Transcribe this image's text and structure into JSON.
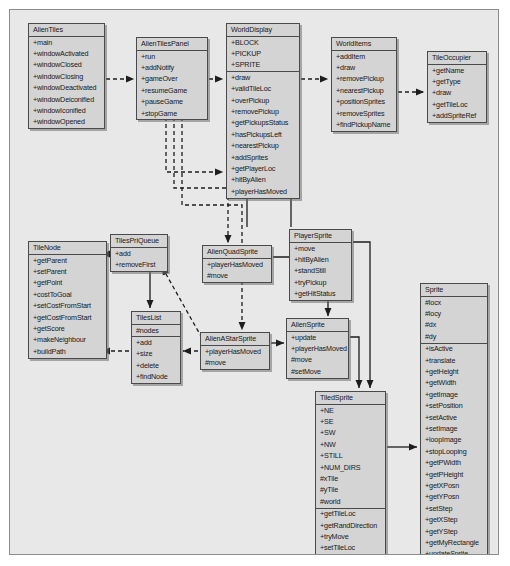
{
  "diagram": {
    "type": "uml-class-diagram",
    "canvas": {
      "width": 490,
      "height": 546,
      "background": "#e8e8e8",
      "border_color": "#8c8c8c"
    },
    "style": {
      "class_fill": "#d4d4d4",
      "class_border": "#4a4a4a",
      "text_color": "#181818"
    },
    "classes": [
      {
        "id": "alien-tiles",
        "name": "AlienTiles",
        "x": 18,
        "y": 13,
        "width": 77,
        "compartments": [
          {
            "members": [
              "+main",
              "+windowActivated",
              "+windowClosed",
              "+windowClosing",
              "+windowDeactivated",
              "+windowDeiconified",
              "+windowIconified",
              "+windowOpened"
            ]
          }
        ]
      },
      {
        "id": "alien-tiles-panel",
        "name": "AlienTilesPanel",
        "x": 126,
        "y": 27,
        "width": 72,
        "compartments": [
          {
            "members": [
              "+run",
              "+addNotify",
              "+gameOver",
              "+resumeGame",
              "+pauseGame",
              "+stopGame"
            ]
          }
        ]
      },
      {
        "id": "world-display",
        "name": "WorldDisplay",
        "x": 216,
        "y": 13,
        "width": 74,
        "compartments": [
          {
            "members": [
              "+BLOCK",
              "+PICKUP",
              "+SPRITE"
            ]
          },
          {
            "members": [
              "+draw",
              "+validTileLoc",
              "+overPickup",
              "+removePickup",
              "+getPickupsStatus",
              "+hasPickupsLeft",
              "+nearestPickup",
              "+addSprites",
              "+getPlayerLoc",
              "+hitByAlien",
              "+playerHasMoved"
            ]
          }
        ]
      },
      {
        "id": "world-items",
        "name": "WorldItems",
        "x": 321,
        "y": 27,
        "width": 66,
        "compartments": [
          {
            "members": [
              "+addItem",
              "+draw",
              "+removePickup",
              "+nearestPickup",
              "+positionSprites",
              "+removeSprites",
              "+findPickupName"
            ]
          }
        ]
      },
      {
        "id": "tile-occupier",
        "name": "TileOccupier",
        "x": 417,
        "y": 41,
        "width": 60,
        "compartments": [
          {
            "members": [
              "+getName",
              "+getType",
              "+draw",
              "+getTileLoc",
              "+addSpriteRef"
            ]
          }
        ]
      },
      {
        "id": "tile-node",
        "name": "TileNode",
        "x": 18,
        "y": 231,
        "width": 79,
        "compartments": [
          {
            "members": [
              "+getParent",
              "+setParent",
              "+getPoint",
              "+costToGoal",
              "+setCostFromStart",
              "+getCostFromStart",
              "+getScore",
              "+makeNeighbour",
              "+buildPath"
            ]
          }
        ]
      },
      {
        "id": "tiles-pri-queue",
        "name": "TilesPriQueue",
        "x": 100,
        "y": 224,
        "width": 58,
        "compartments": [
          {
            "members": [
              "+add",
              "+removeFirst"
            ]
          }
        ]
      },
      {
        "id": "tiles-list",
        "name": "TilesList",
        "x": 121,
        "y": 301,
        "width": 50,
        "compartments": [
          {
            "members": [
              "#nodes"
            ]
          },
          {
            "members": [
              "+add",
              "+size",
              "+delete",
              "+findNode"
            ]
          }
        ]
      },
      {
        "id": "alien-quad-sprite",
        "name": "AlienQuadSprite",
        "x": 192,
        "y": 235,
        "width": 70,
        "compartments": [
          {
            "members": [
              "+playerHasMoved",
              "#move"
            ]
          }
        ]
      },
      {
        "id": "alien-astar-sprite",
        "name": "AlienAStarSprite",
        "x": 190,
        "y": 322,
        "width": 70,
        "compartments": [
          {
            "members": [
              "+playerHasMoved",
              "#move"
            ]
          }
        ]
      },
      {
        "id": "player-sprite",
        "name": "PlayerSprite",
        "x": 279,
        "y": 219,
        "width": 63,
        "compartments": [
          {
            "members": [
              "+move",
              "+hitByAlien",
              "+standStill",
              "+tryPickup",
              "+getHitStatus"
            ]
          }
        ]
      },
      {
        "id": "alien-sprite",
        "name": "AlienSprite",
        "x": 276,
        "y": 308,
        "width": 63,
        "compartments": [
          {
            "members": [
              "+update",
              "+playerHasMoved",
              "#move",
              "#setMove"
            ]
          }
        ]
      },
      {
        "id": "tiled-sprite",
        "name": "TiledSprite",
        "x": 305,
        "y": 381,
        "width": 71,
        "compartments": [
          {
            "members": [
              "+NE",
              "+SE",
              "+SW",
              "+NW",
              "+STILL",
              "+NUM_DIRS",
              "#xTile",
              "#yTile",
              "#world"
            ]
          },
          {
            "members": [
              "+getTileLoc",
              "+getRandDirection",
              "+tryMove",
              "+setTileLoc",
              "+whichQuadrant"
            ]
          }
        ]
      },
      {
        "id": "sprite",
        "name": "Sprite",
        "x": 410,
        "y": 273,
        "width": 68,
        "compartments": [
          {
            "members": [
              "#locx",
              "#locy",
              "#dx",
              "#dy"
            ]
          },
          {
            "members": [
              "+isActive",
              "+translate",
              "+getHeight",
              "+getWidth",
              "+getImage",
              "+setPosition",
              "+setActive",
              "+setImage",
              "+loopImage",
              "+stopLooping",
              "+getPWidth",
              "+getPHeight",
              "+getXPosn",
              "+getYPosn",
              "+setStep",
              "+getXStep",
              "+getYStep",
              "+getMyRectangle",
              "+updateSprite",
              "+drawSprite"
            ]
          }
        ]
      }
    ],
    "connectors": [
      {
        "id": "alien-tiles-to-panel",
        "kind": "dashed-arrow"
      },
      {
        "id": "panel-to-world-display",
        "kind": "dashed-arrow"
      },
      {
        "id": "world-display-to-world-items",
        "kind": "dashed-arrow"
      },
      {
        "id": "world-items-to-tile-occupier",
        "kind": "dashed-arrow"
      },
      {
        "id": "panel-to-player-sprite",
        "kind": "dashed-arrow"
      },
      {
        "id": "panel-to-alien-quad-sprite",
        "kind": "dashed-arrow"
      },
      {
        "id": "panel-to-alien-astar-sprite",
        "kind": "dashed-arrow"
      },
      {
        "id": "world-display-to-player-sprite",
        "kind": "solid-arrow"
      },
      {
        "id": "world-display-to-alien-sprite",
        "kind": "solid-arrow"
      },
      {
        "id": "tiles-pri-queue-to-tile-node",
        "kind": "solid-arrow"
      },
      {
        "id": "tiles-pri-queue-to-tiles-list",
        "kind": "solid-arrow"
      },
      {
        "id": "tiles-list-to-tile-node",
        "kind": "dashed-arrow"
      },
      {
        "id": "alien-astar-to-tiles-list",
        "kind": "dashed-arrow"
      },
      {
        "id": "alien-astar-to-tiles-pri-queue",
        "kind": "dashed-arrow"
      },
      {
        "id": "alien-astar-to-alien-sprite",
        "kind": "solid-arrow"
      },
      {
        "id": "alien-quad-to-alien-sprite",
        "kind": "solid-arrow"
      },
      {
        "id": "player-sprite-to-tiled-sprite",
        "kind": "solid-arrow"
      },
      {
        "id": "alien-sprite-to-tiled-sprite",
        "kind": "solid-arrow"
      },
      {
        "id": "tiled-sprite-to-sprite",
        "kind": "solid-arrow"
      }
    ]
  }
}
